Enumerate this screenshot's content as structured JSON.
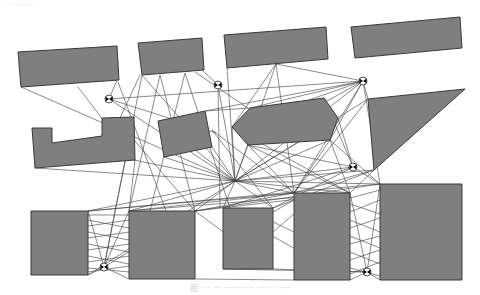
{
  "header": {
    "text": "···· ·······"
  },
  "caption": {
    "text": "图 · ·· ··· ········ ··· ···· ·· ·····"
  },
  "figure": {
    "obstacles": [
      {
        "id": "top-rect-1",
        "points": "18,52 117,46 119,80 21,87"
      },
      {
        "id": "top-rect-2",
        "points": "138,43 202,38 204,70 142,75"
      },
      {
        "id": "top-rect-3",
        "points": "224,35 326,27 328,59 227,68"
      },
      {
        "id": "top-rect-4",
        "points": "351,27 460,17 462,48 355,58"
      },
      {
        "id": "l-shape",
        "points": "32,128 52,128 52,143 102,136 102,118 134,117 135,160 35,168"
      },
      {
        "id": "small-quad",
        "points": "158,121 205,111 212,147 164,157"
      },
      {
        "id": "hexagon",
        "points": "250,108 324,98 338,118 330,140 248,145 232,127"
      },
      {
        "id": "triangle",
        "points": "368,99 465,89 374,170"
      },
      {
        "id": "bottom-rect-1",
        "points": "31,211 88,211 88,275 31,275"
      },
      {
        "id": "bottom-rect-2",
        "points": "129,211 195,211 195,279 129,279"
      },
      {
        "id": "bottom-rect-3",
        "points": "223,208 273,208 273,269 223,269"
      },
      {
        "id": "bottom-rect-4",
        "points": "294,193 350,193 350,280 294,280"
      },
      {
        "id": "bottom-rect-5",
        "points": "380,184 462,184 462,280 380,280"
      }
    ],
    "nodes": [
      {
        "id": "node-1",
        "x": 109,
        "y": 99
      },
      {
        "id": "node-2",
        "x": 218,
        "y": 85
      },
      {
        "id": "node-3",
        "x": 363,
        "y": 81
      },
      {
        "id": "node-4",
        "x": 353,
        "y": 167
      },
      {
        "id": "node-5",
        "x": 104,
        "y": 267
      },
      {
        "id": "node-6",
        "x": 367,
        "y": 272
      },
      {
        "id": "hub",
        "x": 235,
        "y": 181
      }
    ],
    "edges": [
      [
        109,
        99,
        235,
        181
      ],
      [
        109,
        99,
        363,
        81
      ],
      [
        109,
        99,
        216,
        133
      ],
      [
        109,
        99,
        117,
        80
      ],
      [
        218,
        85,
        235,
        181
      ],
      [
        218,
        85,
        220,
        208
      ],
      [
        218,
        85,
        202,
        70
      ],
      [
        363,
        81,
        235,
        181
      ],
      [
        363,
        81,
        250,
        108
      ],
      [
        363,
        81,
        248,
        145
      ],
      [
        363,
        81,
        294,
        193
      ],
      [
        363,
        81,
        380,
        184
      ],
      [
        363,
        81,
        368,
        99
      ],
      [
        363,
        81,
        232,
        127
      ],
      [
        363,
        81,
        330,
        140
      ],
      [
        353,
        167,
        235,
        181
      ],
      [
        353,
        167,
        273,
        208
      ],
      [
        353,
        167,
        324,
        98
      ],
      [
        353,
        167,
        223,
        208
      ],
      [
        353,
        167,
        338,
        118
      ],
      [
        353,
        167,
        380,
        184
      ],
      [
        353,
        167,
        248,
        145
      ],
      [
        235,
        181,
        88,
        211
      ],
      [
        235,
        181,
        88,
        275
      ],
      [
        235,
        181,
        129,
        211
      ],
      [
        235,
        181,
        195,
        211
      ],
      [
        235,
        181,
        223,
        208
      ],
      [
        235,
        181,
        273,
        208
      ],
      [
        235,
        181,
        294,
        193
      ],
      [
        235,
        181,
        350,
        193
      ],
      [
        235,
        181,
        380,
        184
      ],
      [
        235,
        181,
        134,
        160
      ],
      [
        235,
        181,
        35,
        168
      ],
      [
        235,
        181,
        158,
        121
      ],
      [
        235,
        181,
        164,
        157
      ],
      [
        235,
        181,
        212,
        147
      ],
      [
        235,
        181,
        232,
        127
      ],
      [
        235,
        181,
        248,
        145
      ],
      [
        235,
        181,
        330,
        140
      ],
      [
        235,
        181,
        338,
        118
      ],
      [
        235,
        181,
        374,
        170
      ],
      [
        235,
        181,
        368,
        99
      ],
      [
        235,
        181,
        21,
        87
      ],
      [
        235,
        181,
        142,
        75
      ],
      [
        235,
        181,
        227,
        68
      ],
      [
        235,
        181,
        276,
        64
      ],
      [
        104,
        267,
        88,
        211
      ],
      [
        104,
        267,
        88,
        275
      ],
      [
        104,
        267,
        129,
        211
      ],
      [
        104,
        267,
        195,
        211
      ],
      [
        104,
        267,
        142,
        75
      ],
      [
        104,
        267,
        134,
        117
      ],
      [
        367,
        272,
        350,
        193
      ],
      [
        367,
        272,
        380,
        184
      ],
      [
        367,
        272,
        350,
        280
      ],
      [
        367,
        272,
        380,
        280
      ],
      [
        367,
        272,
        273,
        269
      ],
      [
        88,
        215,
        129,
        215
      ],
      [
        88,
        220,
        129,
        228
      ],
      [
        88,
        226,
        129,
        220
      ],
      [
        88,
        232,
        129,
        240
      ],
      [
        88,
        238,
        129,
        232
      ],
      [
        88,
        244,
        129,
        252
      ],
      [
        88,
        250,
        129,
        244
      ],
      [
        88,
        256,
        129,
        264
      ],
      [
        88,
        262,
        129,
        256
      ],
      [
        88,
        268,
        129,
        272
      ],
      [
        88,
        272,
        129,
        266
      ],
      [
        350,
        198,
        380,
        190
      ],
      [
        350,
        204,
        380,
        214
      ],
      [
        350,
        212,
        380,
        200
      ],
      [
        350,
        220,
        380,
        232
      ],
      [
        350,
        228,
        380,
        218
      ],
      [
        350,
        236,
        380,
        248
      ],
      [
        350,
        244,
        380,
        236
      ],
      [
        350,
        252,
        380,
        264
      ],
      [
        350,
        260,
        380,
        250
      ],
      [
        350,
        268,
        380,
        276
      ],
      [
        350,
        274,
        380,
        262
      ],
      [
        273,
        212,
        294,
        200
      ],
      [
        273,
        222,
        294,
        232
      ],
      [
        273,
        232,
        294,
        214
      ],
      [
        160,
        75,
        195,
        211
      ],
      [
        160,
        75,
        129,
        211
      ],
      [
        185,
        73,
        230,
        208
      ],
      [
        185,
        73,
        150,
        211
      ],
      [
        195,
        72,
        248,
        108
      ],
      [
        140,
        75,
        120,
        118
      ],
      [
        78,
        87,
        134,
        160
      ],
      [
        118,
        82,
        166,
        211
      ],
      [
        276,
        64,
        294,
        193
      ],
      [
        276,
        64,
        232,
        127
      ],
      [
        276,
        64,
        363,
        81
      ],
      [
        134,
        140,
        195,
        211
      ],
      [
        135,
        160,
        129,
        211
      ],
      [
        212,
        130,
        273,
        208
      ],
      [
        212,
        130,
        294,
        193
      ],
      [
        205,
        111,
        250,
        108
      ],
      [
        205,
        111,
        363,
        81
      ],
      [
        330,
        140,
        380,
        184
      ],
      [
        330,
        140,
        350,
        193
      ],
      [
        248,
        145,
        294,
        193
      ],
      [
        248,
        145,
        350,
        193
      ],
      [
        232,
        127,
        350,
        193
      ],
      [
        330,
        140,
        294,
        193
      ],
      [
        374,
        170,
        294,
        193
      ],
      [
        374,
        170,
        350,
        193
      ],
      [
        374,
        170,
        273,
        208
      ],
      [
        368,
        99,
        294,
        193
      ],
      [
        195,
        211,
        350,
        193
      ],
      [
        195,
        211,
        294,
        193
      ],
      [
        195,
        211,
        380,
        184
      ],
      [
        129,
        211,
        294,
        193
      ],
      [
        129,
        211,
        350,
        193
      ],
      [
        88,
        211,
        294,
        193
      ],
      [
        88,
        211,
        380,
        184
      ],
      [
        195,
        279,
        294,
        280
      ],
      [
        223,
        269,
        367,
        272
      ],
      [
        195,
        211,
        273,
        269
      ],
      [
        223,
        208,
        350,
        280
      ],
      [
        129,
        279,
        104,
        267
      ]
    ]
  }
}
